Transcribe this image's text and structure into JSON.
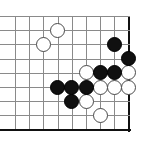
{
  "figure": {
    "kind": "go-board-diagram",
    "board": {
      "columns": 9,
      "rows": 9,
      "cell_size": 14.2,
      "origin_x": 15,
      "origin_y": 16,
      "stone_diameter": 15,
      "grid_color": "#8a8a8a",
      "edge_color": "#111111",
      "background_color": "#ffffff",
      "right_edge_column": 8,
      "bottom_edge_row": 8
    },
    "stone_colors": {
      "black": "#101010",
      "white": "#ffffff",
      "white_outline": "#4a4a4a"
    },
    "stones": [
      {
        "color": "white",
        "col": 3,
        "row": 1,
        "label": "white-stone-c3-r1"
      },
      {
        "color": "white",
        "col": 2,
        "row": 2,
        "label": "white-stone-c2-r2"
      },
      {
        "color": "black",
        "col": 7,
        "row": 2,
        "label": "black-stone-c7-r2"
      },
      {
        "color": "black",
        "col": 8,
        "row": 3,
        "label": "black-stone-c8-r3"
      },
      {
        "color": "white",
        "col": 5,
        "row": 4,
        "label": "white-stone-c5-r4"
      },
      {
        "color": "black",
        "col": 6,
        "row": 4,
        "label": "black-stone-c6-r4"
      },
      {
        "color": "black",
        "col": 7,
        "row": 4,
        "label": "black-stone-c7-r4"
      },
      {
        "color": "white",
        "col": 8,
        "row": 4,
        "label": "white-stone-c8-r4"
      },
      {
        "color": "black",
        "col": 3,
        "row": 5,
        "label": "black-stone-c3-r5"
      },
      {
        "color": "black",
        "col": 4,
        "row": 5,
        "label": "black-stone-c4-r5"
      },
      {
        "color": "black",
        "col": 5,
        "row": 5,
        "label": "black-stone-c5-r5"
      },
      {
        "color": "white",
        "col": 6,
        "row": 5,
        "label": "white-stone-c6-r5"
      },
      {
        "color": "white",
        "col": 7,
        "row": 5,
        "label": "white-stone-c7-r5"
      },
      {
        "color": "white",
        "col": 8,
        "row": 5,
        "label": "white-stone-c8-r5"
      },
      {
        "color": "black",
        "col": 4,
        "row": 6,
        "label": "black-stone-c4-r6"
      },
      {
        "color": "white",
        "col": 5,
        "row": 6,
        "label": "white-stone-c5-r6"
      },
      {
        "color": "white",
        "col": 6,
        "row": 7,
        "label": "white-stone-c6-r7"
      }
    ]
  }
}
